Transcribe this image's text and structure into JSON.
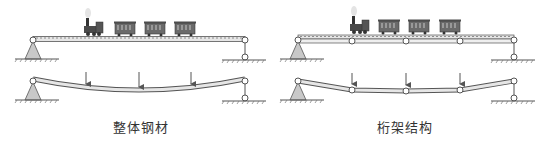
{
  "panels": [
    {
      "id": "solid-steel",
      "caption": "整体钢材",
      "description": "Solid steel beam: train on simply-supported continuous beam; under three point loads it deflects as a smooth curve"
    },
    {
      "id": "truss",
      "caption": "桁架结构",
      "description": "Truss structure: beam made of pinned segments with intermediate nodes; under three point loads segments rotate at the joints"
    }
  ],
  "colors": {
    "line": "#555555",
    "beam_fill": "#e6e6e6",
    "support_fill": "#c8c8c8",
    "train": "#4a4a4a",
    "car_body": "#6a6a6a",
    "arrow": "#555555"
  }
}
